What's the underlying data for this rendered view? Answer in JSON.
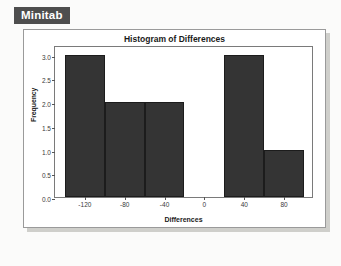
{
  "badge": {
    "label": "Minitab"
  },
  "card": {
    "title": "Histogram of Differences"
  },
  "chart_data": {
    "type": "bar",
    "title": "Histogram of Differences",
    "xlabel": "Differences",
    "ylabel": "Frequency",
    "subtitle": "",
    "grid": false,
    "legend": "none",
    "bin_width": 40,
    "bin_edges": [
      -140,
      -100,
      -60,
      -20,
      20,
      60,
      100
    ],
    "categories": [
      "-140 to -100",
      "-100 to -60",
      "-60 to -20",
      "-20 to 20",
      "20 to 60",
      "60 to 100"
    ],
    "bin_centers": [
      -120,
      -80,
      -40,
      0,
      40,
      80
    ],
    "values": [
      3,
      2,
      2,
      0,
      3,
      1
    ],
    "xlim": [
      -150,
      110
    ],
    "ylim": [
      0,
      3.2
    ],
    "xticks": [
      -120,
      -80,
      -40,
      0,
      40,
      80
    ],
    "xtick_labels": [
      "-120",
      "-80",
      "-40",
      "0",
      "40",
      "80"
    ],
    "yticks": [
      0.0,
      0.5,
      1.0,
      1.5,
      2.0,
      2.5,
      3.0
    ],
    "ytick_labels": [
      "0.0",
      "0.5",
      "1.0",
      "1.5",
      "2.0",
      "2.5",
      "3.0"
    ],
    "bar_color": "#343434",
    "bar_edge_color": "#1c1c1c"
  },
  "colors": {
    "badge_bg": "#4e4e4e",
    "badge_text": "#ffffff",
    "page_bg": "#fbfbfa",
    "card_bg": "#ffffff",
    "card_border": "#9a9a9a",
    "shadow": "#cfcfcb",
    "axis": "#7a7a7a",
    "text": "#1a1a1a"
  }
}
